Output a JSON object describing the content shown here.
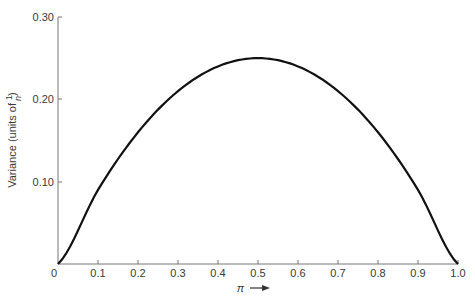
{
  "chart_data": {
    "type": "line",
    "title": "",
    "xlabel": "π",
    "ylabel": "Variance (units of 1/n)",
    "ylabel_prefix": "Variance (units of ",
    "ylabel_frac_num": "1",
    "ylabel_frac_den": "n",
    "ylabel_suffix": ")",
    "xlim": [
      0,
      1.0
    ],
    "ylim": [
      0,
      0.3
    ],
    "x_ticks": [
      "0",
      "0.1",
      "0.2",
      "0.3",
      "0.4",
      "0.5",
      "0.6",
      "0.7",
      "0.8",
      "0.9",
      "1.0"
    ],
    "y_ticks": [
      "0.10",
      "0.20",
      "0.30"
    ],
    "grid": false,
    "legend": null,
    "series": [
      {
        "name": "π(1−π)",
        "x": [
          0,
          0.1,
          0.2,
          0.3,
          0.4,
          0.5,
          0.6,
          0.7,
          0.8,
          0.9,
          1.0
        ],
        "values": [
          0,
          0.09,
          0.16,
          0.21,
          0.24,
          0.25,
          0.24,
          0.21,
          0.16,
          0.09,
          0
        ],
        "color": "#111111"
      }
    ]
  }
}
